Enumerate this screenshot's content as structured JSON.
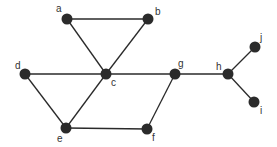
{
  "graph": {
    "node_color": "#2b2b2b",
    "edge_color": "#2a2a2a",
    "node_radius": 5.5,
    "nodes": [
      {
        "id": "a",
        "label": "a",
        "x": 67,
        "y": 19,
        "lx": 56,
        "ly": 12
      },
      {
        "id": "b",
        "label": "b",
        "x": 148,
        "y": 19,
        "lx": 155,
        "ly": 15
      },
      {
        "id": "c",
        "label": "c",
        "x": 106,
        "y": 74,
        "lx": 111,
        "ly": 86
      },
      {
        "id": "d",
        "label": "d",
        "x": 25,
        "y": 74,
        "lx": 15,
        "ly": 69
      },
      {
        "id": "e",
        "label": "e",
        "x": 66,
        "y": 128,
        "lx": 57,
        "ly": 142
      },
      {
        "id": "f",
        "label": "f",
        "x": 147,
        "y": 129,
        "lx": 152,
        "ly": 141
      },
      {
        "id": "g",
        "label": "g",
        "x": 175,
        "y": 74,
        "lx": 178,
        "ly": 67
      },
      {
        "id": "h",
        "label": "h",
        "x": 228,
        "y": 74,
        "lx": 216,
        "ly": 70
      },
      {
        "id": "j",
        "label": "j",
        "x": 255,
        "y": 47,
        "lx": 260,
        "ly": 41
      },
      {
        "id": "i",
        "label": "i",
        "x": 254,
        "y": 102,
        "lx": 260,
        "ly": 114
      }
    ],
    "edges": [
      [
        "a",
        "b"
      ],
      [
        "a",
        "c"
      ],
      [
        "b",
        "c"
      ],
      [
        "d",
        "c"
      ],
      [
        "d",
        "e"
      ],
      [
        "c",
        "e"
      ],
      [
        "c",
        "g"
      ],
      [
        "e",
        "f"
      ],
      [
        "f",
        "g"
      ],
      [
        "g",
        "h"
      ],
      [
        "h",
        "j"
      ],
      [
        "h",
        "i"
      ]
    ]
  }
}
